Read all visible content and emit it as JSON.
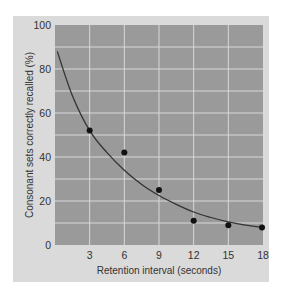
{
  "chart_data": {
    "type": "scatter",
    "title": "",
    "xlabel": "Retention interval (seconds)",
    "ylabel": "Consonant sets correctly recalled (%)",
    "x_ticks": [
      3,
      6,
      9,
      12,
      15,
      18
    ],
    "y_ticks": [
      0,
      20,
      40,
      60,
      80,
      100
    ],
    "xlim": [
      0,
      18
    ],
    "ylim": [
      0,
      100
    ],
    "grid": true,
    "legend": null,
    "series": [
      {
        "name": "Observed recall",
        "kind": "points",
        "x": [
          3,
          6,
          9,
          12,
          15,
          18
        ],
        "y": [
          52,
          42,
          25,
          11,
          9,
          8
        ]
      },
      {
        "name": "Fitted decay curve",
        "kind": "line",
        "x": [
          0.2,
          1.5,
          3,
          4.5,
          6,
          7.5,
          9,
          10.5,
          12,
          13.5,
          15,
          16.5,
          18
        ],
        "y": [
          88,
          68,
          52,
          42,
          34,
          27.5,
          22.5,
          18.5,
          15,
          12.5,
          10.5,
          9,
          8
        ]
      }
    ],
    "colors": {
      "panel": "#dadada",
      "plot_area": "#9a9a9a",
      "grid": "#d8d8d8",
      "points": "#111111",
      "curve": "#333333"
    }
  }
}
